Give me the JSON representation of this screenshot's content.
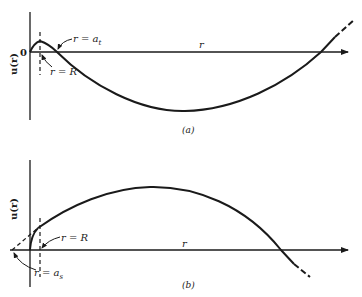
{
  "figure": {
    "panels": [
      {
        "id": "a",
        "caption": "(a)",
        "y_axis_label": "u(r)",
        "x_axis_label": "r",
        "origin_label": "0",
        "annotations": [
          {
            "text_main": "r = a",
            "subscript": "t",
            "meaning": "scattering length (positive)"
          },
          {
            "text_main": "r = R",
            "subscript": "",
            "meaning": "potential range"
          }
        ]
      },
      {
        "id": "b",
        "caption": "(b)",
        "y_axis_label": "u(r)",
        "x_axis_label": "r",
        "annotations": [
          {
            "text_main": "r = R",
            "subscript": "",
            "meaning": "potential range"
          },
          {
            "text_main": "r = a",
            "subscript": "s",
            "meaning": "scattering length (negative)"
          }
        ]
      }
    ],
    "colors": {
      "line": "#1a1a1a",
      "background": "#ffffff"
    }
  }
}
